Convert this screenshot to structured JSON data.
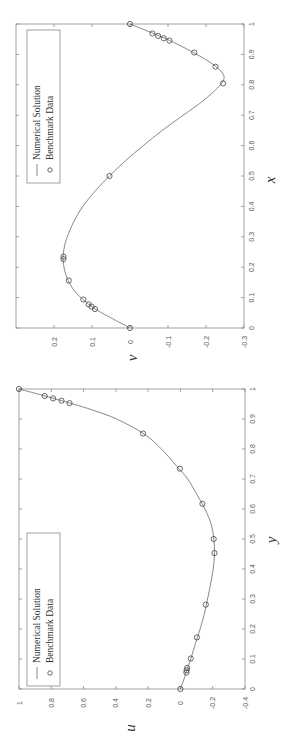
{
  "chart_data": [
    {
      "type": "line",
      "title": "",
      "rotated": "90deg counter-clockwise on page",
      "xlabel": "x",
      "ylabel": "v",
      "xlim": [
        0,
        1
      ],
      "ylim": [
        -0.3,
        0.3
      ],
      "xticks": [
        "0",
        "0.1",
        "0.2",
        "0.3",
        "0.4",
        "0.5",
        "0.6",
        "0.7",
        "0.8",
        "0.9",
        "1"
      ],
      "yticks": [
        "-0.3",
        "-0.2",
        "-0.1",
        "0",
        "0.1",
        "0.2"
      ],
      "grid": false,
      "legend": {
        "position": "upper-left (rotated)",
        "entries": [
          "Numerical Solution",
          "Benchmark Data"
        ]
      },
      "series": [
        {
          "name": "Numerical Solution",
          "style": "line",
          "x": [
            0,
            0.03,
            0.06,
            0.09,
            0.12,
            0.15,
            0.18,
            0.21,
            0.24,
            0.27,
            0.3,
            0.35,
            0.4,
            0.45,
            0.5,
            0.55,
            0.6,
            0.65,
            0.7,
            0.75,
            0.8,
            0.83,
            0.86,
            0.89,
            0.92,
            0.95,
            0.98,
            1.0
          ],
          "values": [
            0,
            0.045,
            0.088,
            0.12,
            0.145,
            0.16,
            0.17,
            0.175,
            0.176,
            0.172,
            0.165,
            0.148,
            0.124,
            0.092,
            0.054,
            0.012,
            -0.035,
            -0.085,
            -0.14,
            -0.195,
            -0.238,
            -0.247,
            -0.226,
            -0.19,
            -0.146,
            -0.097,
            -0.04,
            0
          ]
        },
        {
          "name": "Benchmark Data",
          "style": "circle",
          "x": [
            1.0,
            0.9688,
            0.9609,
            0.9531,
            0.9453,
            0.9063,
            0.8594,
            0.8047,
            0.5,
            0.2344,
            0.2266,
            0.1563,
            0.0938,
            0.0781,
            0.0703,
            0.0625,
            0.0
          ],
          "values": [
            0,
            -0.059,
            -0.074,
            -0.089,
            -0.104,
            -0.169,
            -0.225,
            -0.245,
            0.054,
            0.175,
            0.175,
            0.161,
            0.123,
            0.109,
            0.101,
            0.092,
            0
          ]
        }
      ]
    },
    {
      "type": "line",
      "title": "",
      "rotated": "90deg counter-clockwise on page",
      "xlabel": "y",
      "ylabel": "u",
      "xlim": [
        0,
        1
      ],
      "ylim": [
        -0.4,
        1
      ],
      "xticks": [
        "0",
        "0.1",
        "0.2",
        "0.3",
        "0.4",
        "0.5",
        "0.6",
        "0.7",
        "0.8",
        "0.9",
        "1"
      ],
      "yticks": [
        "-0.4",
        "-0.2",
        "0",
        "0.2",
        "0.4",
        "0.6",
        "0.8",
        "1"
      ],
      "grid": false,
      "legend": {
        "position": "upper-left (rotated)",
        "entries": [
          "Numerical Solution",
          "Benchmark Data"
        ]
      },
      "series": [
        {
          "name": "Numerical Solution",
          "style": "line",
          "x": [
            0,
            0.03,
            0.06,
            0.1,
            0.15,
            0.2,
            0.25,
            0.3,
            0.35,
            0.4,
            0.45,
            0.5,
            0.55,
            0.6,
            0.65,
            0.7,
            0.75,
            0.8,
            0.85,
            0.9,
            0.93,
            0.95,
            0.97,
            0.985,
            1.0
          ],
          "values": [
            0,
            -0.02,
            -0.038,
            -0.064,
            -0.092,
            -0.122,
            -0.148,
            -0.168,
            -0.187,
            -0.203,
            -0.211,
            -0.207,
            -0.19,
            -0.152,
            -0.1,
            -0.045,
            0.035,
            0.118,
            0.225,
            0.395,
            0.545,
            0.665,
            0.795,
            0.895,
            1.0
          ]
        },
        {
          "name": "Benchmark Data",
          "style": "circle",
          "x": [
            1.0,
            0.9766,
            0.9688,
            0.9609,
            0.9531,
            0.8516,
            0.7344,
            0.6172,
            0.5,
            0.4531,
            0.2813,
            0.1719,
            0.1016,
            0.0703,
            0.0625,
            0.0547,
            0.0
          ],
          "values": [
            1.0,
            0.841,
            0.789,
            0.737,
            0.687,
            0.231,
            0.003,
            -0.136,
            -0.206,
            -0.211,
            -0.157,
            -0.102,
            -0.064,
            -0.042,
            -0.038,
            -0.037,
            0
          ]
        }
      ]
    }
  ],
  "plots": {
    "top": {
      "xlabel": "x",
      "ylabel": "v",
      "legend_line": "Numerical Solution",
      "legend_marker": "Benchmark Data"
    },
    "bottom": {
      "xlabel": "y",
      "ylabel": "u",
      "legend_line": "Numerical Solution",
      "legend_marker": "Benchmark Data"
    }
  },
  "colors": {
    "axis": "#8a8a8a",
    "curve": "#6a6a6a",
    "marker": "#444444",
    "text": "#333333"
  }
}
